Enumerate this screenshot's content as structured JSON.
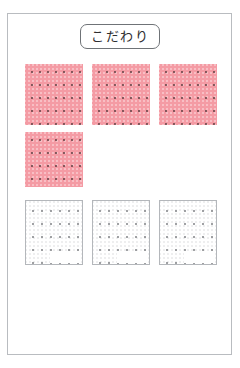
{
  "page": {
    "title": "こだわり",
    "background_color": "#ffffff",
    "frame_color": "#b9bcc0"
  },
  "title_box": {
    "label": "こだわり",
    "border_color": "#6f7377",
    "text_color": "#2e2e30"
  },
  "colors": {
    "pink_swatch": "#f49ba4",
    "white_swatch": "#ffffff",
    "swatch_border": "#b4b7bb",
    "dot_dark": "#5a3c3e",
    "dot_gray": "#787a7e"
  },
  "grid": {
    "pink_row_label": "pink-swatch-row",
    "white_row_label": "white-swatch-row",
    "pink_swatches": [
      {
        "id": "pink-1",
        "fill": "#f49ba4",
        "dot_columns": 7,
        "dot_rows": 4
      },
      {
        "id": "pink-2",
        "fill": "#f49ba4",
        "dot_columns": 7,
        "dot_rows": 4
      },
      {
        "id": "pink-3",
        "fill": "#f49ba4",
        "dot_columns": 7,
        "dot_rows": 4
      },
      {
        "id": "pink-4",
        "fill": "#f49ba4",
        "dot_columns": 7,
        "dot_rows": 4
      }
    ],
    "white_swatches": [
      {
        "id": "white-1",
        "fill": "#ffffff",
        "dot_columns": 6,
        "dot_rows": 5
      },
      {
        "id": "white-2",
        "fill": "#ffffff",
        "dot_columns": 6,
        "dot_rows": 5
      },
      {
        "id": "white-3",
        "fill": "#ffffff",
        "dot_columns": 6,
        "dot_rows": 5
      }
    ]
  }
}
